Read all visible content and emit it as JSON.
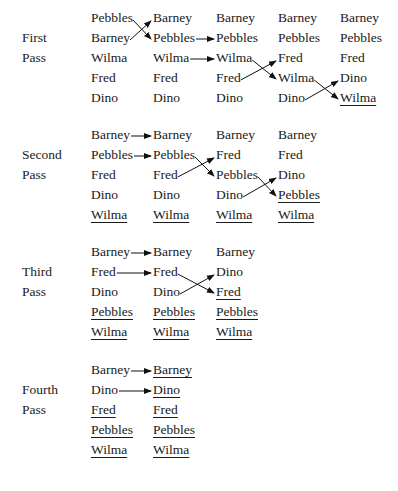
{
  "passes": [
    {
      "label1": "First",
      "label2": "Pass",
      "columns": [
        [
          {
            "t": "Pebbles",
            "u": false
          },
          {
            "t": "Barney",
            "u": false
          },
          {
            "t": "Wilma",
            "u": false
          },
          {
            "t": "Fred",
            "u": false
          },
          {
            "t": "Dino",
            "u": false
          }
        ],
        [
          {
            "t": "Barney",
            "u": false
          },
          {
            "t": "Pebbles",
            "u": false
          },
          {
            "t": "Wilma",
            "u": false
          },
          {
            "t": "Fred",
            "u": false
          },
          {
            "t": "Dino",
            "u": false
          }
        ],
        [
          {
            "t": "Barney",
            "u": false
          },
          {
            "t": "Pebbles",
            "u": false
          },
          {
            "t": "Wilma",
            "u": false
          },
          {
            "t": "Fred",
            "u": false
          },
          {
            "t": "Dino",
            "u": false
          }
        ],
        [
          {
            "t": "Barney",
            "u": false
          },
          {
            "t": "Pebbles",
            "u": false
          },
          {
            "t": "Fred",
            "u": false
          },
          {
            "t": "Wilma",
            "u": false
          },
          {
            "t": "Dino",
            "u": false
          }
        ],
        [
          {
            "t": "Barney",
            "u": false
          },
          {
            "t": "Pebbles",
            "u": false
          },
          {
            "t": "Fred",
            "u": false
          },
          {
            "t": "Dino",
            "u": false
          },
          {
            "t": "Wilma",
            "u": true
          }
        ]
      ],
      "moves": [
        {
          "col": 0,
          "type": "swap",
          "rows": [
            0,
            1
          ]
        },
        {
          "col": 1,
          "type": "straight",
          "rows": [
            1,
            2
          ]
        },
        {
          "col": 2,
          "type": "swap",
          "rows": [
            2,
            3
          ]
        },
        {
          "col": 3,
          "type": "swap",
          "rows": [
            3,
            4
          ]
        }
      ]
    },
    {
      "label1": "Second",
      "label2": "Pass",
      "columns": [
        [
          {
            "t": "Barney",
            "u": false
          },
          {
            "t": "Pebbles",
            "u": false
          },
          {
            "t": "Fred",
            "u": false
          },
          {
            "t": "Dino",
            "u": false
          },
          {
            "t": "Wilma",
            "u": true
          }
        ],
        [
          {
            "t": "Barney",
            "u": false
          },
          {
            "t": "Pebbles",
            "u": false
          },
          {
            "t": "Fred",
            "u": false
          },
          {
            "t": "Dino",
            "u": false
          },
          {
            "t": "Wilma",
            "u": true
          }
        ],
        [
          {
            "t": "Barney",
            "u": false
          },
          {
            "t": "Fred",
            "u": false
          },
          {
            "t": "Pebbles",
            "u": false
          },
          {
            "t": "Dino",
            "u": false
          },
          {
            "t": "Wilma",
            "u": true
          }
        ],
        [
          {
            "t": "Barney",
            "u": false
          },
          {
            "t": "Fred",
            "u": false
          },
          {
            "t": "Dino",
            "u": false
          },
          {
            "t": "Pebbles",
            "u": true
          },
          {
            "t": "Wilma",
            "u": true
          }
        ]
      ],
      "moves": [
        {
          "col": 0,
          "type": "straight",
          "rows": [
            0,
            1
          ]
        },
        {
          "col": 1,
          "type": "swap",
          "rows": [
            1,
            2
          ]
        },
        {
          "col": 2,
          "type": "swap",
          "rows": [
            2,
            3
          ]
        }
      ]
    },
    {
      "label1": "Third",
      "label2": "Pass",
      "columns": [
        [
          {
            "t": "Barney",
            "u": false
          },
          {
            "t": "Fred",
            "u": false
          },
          {
            "t": "Dino",
            "u": false
          },
          {
            "t": "Pebbles",
            "u": true
          },
          {
            "t": "Wilma",
            "u": true
          }
        ],
        [
          {
            "t": "Barney",
            "u": false
          },
          {
            "t": "Fred",
            "u": false
          },
          {
            "t": "Dino",
            "u": false
          },
          {
            "t": "Pebbles",
            "u": true
          },
          {
            "t": "Wilma",
            "u": true
          }
        ],
        [
          {
            "t": "Barney",
            "u": false
          },
          {
            "t": "Dino",
            "u": false
          },
          {
            "t": "Fred",
            "u": true
          },
          {
            "t": "Pebbles",
            "u": true
          },
          {
            "t": "Wilma",
            "u": true
          }
        ]
      ],
      "moves": [
        {
          "col": 0,
          "type": "straight",
          "rows": [
            0,
            1
          ]
        },
        {
          "col": 1,
          "type": "swap",
          "rows": [
            1,
            2
          ]
        }
      ]
    },
    {
      "label1": "Fourth",
      "label2": "Pass",
      "columns": [
        [
          {
            "t": "Barney",
            "u": false
          },
          {
            "t": "Dino",
            "u": false
          },
          {
            "t": "Fred",
            "u": true
          },
          {
            "t": "Pebbles",
            "u": true
          },
          {
            "t": "Wilma",
            "u": true
          }
        ],
        [
          {
            "t": "Barney",
            "u": true
          },
          {
            "t": "Dino",
            "u": true
          },
          {
            "t": "Fred",
            "u": true
          },
          {
            "t": "Pebbles",
            "u": true
          },
          {
            "t": "Wilma",
            "u": true
          }
        ]
      ],
      "moves": [
        {
          "col": 0,
          "type": "straight",
          "rows": [
            0,
            1
          ]
        }
      ]
    }
  ]
}
